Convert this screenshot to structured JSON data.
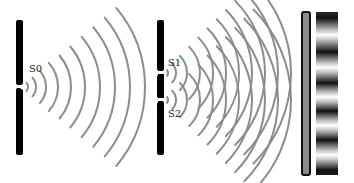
{
  "diagram": {
    "labels": {
      "s0": "S0",
      "s1": "S1",
      "s2": "S2"
    },
    "colors": {
      "barrier": "#000000",
      "wave": "#8c8c8c",
      "screen_border": "#111111",
      "screen_fill": "#8a8a8a",
      "background": "#ffffff"
    },
    "barrier1": {
      "x": 16,
      "y": 20,
      "width": 7,
      "height": 135,
      "slit_y": 87
    },
    "barrier2": {
      "x": 157,
      "y": 20,
      "width": 7,
      "height": 135,
      "slit1_y": 73,
      "slit2_y": 100
    },
    "screen": {
      "x": 302,
      "y": 12,
      "width": 8,
      "height": 163
    },
    "fringes": {
      "x": 316,
      "y": 12,
      "width": 22,
      "height": 163,
      "dark_band_centers_y": [
        18,
        52,
        83,
        111,
        140,
        170
      ]
    },
    "waves_s0": {
      "cx": 22,
      "cy": 87,
      "radii": [
        6,
        14,
        24,
        36,
        49,
        63,
        78,
        93,
        108,
        123,
        137
      ]
    },
    "waves_s1": {
      "cx": 163,
      "cy": 73,
      "radii": [
        5,
        13,
        24,
        37,
        50,
        63,
        76,
        89,
        102,
        115,
        128
      ]
    },
    "waves_s2": {
      "cx": 163,
      "cy": 100,
      "radii": [
        5,
        13,
        24,
        37,
        50,
        63,
        76,
        89,
        102,
        115,
        128
      ]
    }
  }
}
